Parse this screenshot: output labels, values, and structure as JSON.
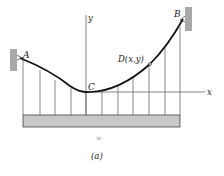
{
  "figure": {
    "caption": "(a)",
    "labels": {
      "point_a": "A",
      "point_b": "B",
      "point_c": "C",
      "point_d": "D(x,y)",
      "axis_x": "x",
      "axis_y": "y",
      "load": "w"
    },
    "colors": {
      "cable": "#111111",
      "hanger": "#555555",
      "deck_fill": "#c8c8c8",
      "deck_stroke": "#444444",
      "wall_fill": "#a8a8a8",
      "axis": "#666666"
    },
    "hanger_count": 11
  }
}
